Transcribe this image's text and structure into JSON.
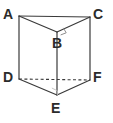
{
  "figure": {
    "kind": "triangular-prism-diagram",
    "width": 113,
    "height": 123,
    "background_color": "#ffffff",
    "line_color": "#3a3a3a",
    "label_color": "#2b2b2b",
    "stroke_width": 1.1,
    "labels": {
      "a": "A",
      "b": "B",
      "c": "C",
      "d": "D",
      "e": "E",
      "f": "F"
    },
    "label_positions": {
      "a": {
        "x": 3,
        "y": 7
      },
      "b": {
        "x": 52,
        "y": 36
      },
      "c": {
        "x": 93,
        "y": 7
      },
      "d": {
        "x": 3,
        "y": 70
      },
      "e": {
        "x": 51,
        "y": 101
      },
      "f": {
        "x": 93,
        "y": 70
      }
    },
    "vertices": {
      "a": {
        "x": 19,
        "y": 16
      },
      "b": {
        "x": 57,
        "y": 32
      },
      "c": {
        "x": 90,
        "y": 17
      },
      "d": {
        "x": 19,
        "y": 79
      },
      "e": {
        "x": 57,
        "y": 95
      },
      "f": {
        "x": 90,
        "y": 80
      }
    },
    "edges": [
      {
        "name": "edge-ac",
        "from": "a",
        "to": "c",
        "style": "solid"
      },
      {
        "name": "edge-ab",
        "from": "a",
        "to": "b",
        "style": "solid"
      },
      {
        "name": "edge-bc",
        "from": "b",
        "to": "c",
        "style": "solid"
      },
      {
        "name": "edge-ad",
        "from": "a",
        "to": "d",
        "style": "solid"
      },
      {
        "name": "edge-be",
        "from": "b",
        "to": "e",
        "style": "solid"
      },
      {
        "name": "edge-cf",
        "from": "c",
        "to": "f",
        "style": "solid"
      },
      {
        "name": "edge-de",
        "from": "d",
        "to": "e",
        "style": "solid"
      },
      {
        "name": "edge-ef",
        "from": "e",
        "to": "f",
        "style": "solid"
      },
      {
        "name": "edge-df",
        "from": "d",
        "to": "f",
        "style": "dashed"
      }
    ],
    "right_angle_markers": [
      {
        "name": "right-angle-at-b",
        "at": "b",
        "visible": true
      },
      {
        "name": "right-angle-at-e",
        "at": "e",
        "visible": true
      }
    ]
  }
}
